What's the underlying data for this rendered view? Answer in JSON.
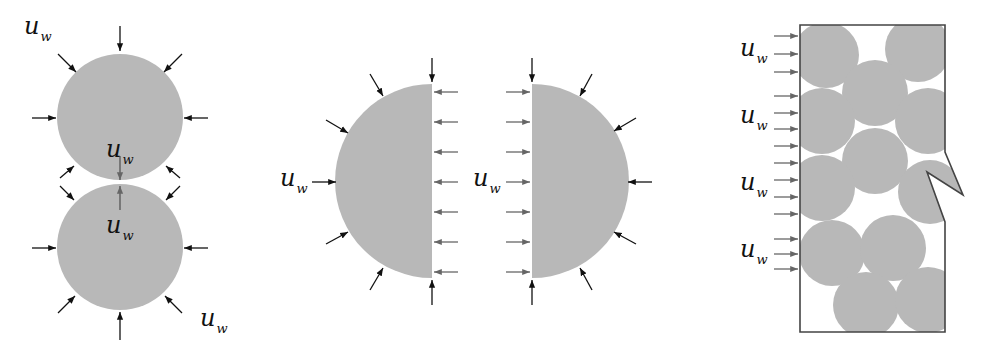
{
  "colors": {
    "particle_fill": "#b8b8b8",
    "arrow_dark": "#111111",
    "arrow_gray": "#666666",
    "box_stroke": "#444444",
    "background": "#ffffff"
  },
  "panels": [
    {
      "id": "two-touching-particles",
      "description": "Two circular particles in contact with pressure arrows acting around the boundary and at the contact point",
      "labels": [
        {
          "main": "u",
          "sub": "w",
          "x": 24,
          "y": 14
        },
        {
          "main": "u",
          "sub": "w",
          "x": 106,
          "y": 137
        },
        {
          "main": "u",
          "sub": "w",
          "x": 106,
          "y": 213
        },
        {
          "main": "u",
          "sub": "w",
          "x": 200,
          "y": 306
        }
      ]
    },
    {
      "id": "split-particle-halves",
      "description": "A particle split into two half-disks with uniform gray arrows on the flat cut faces",
      "labels": [
        {
          "main": "u",
          "sub": "w",
          "x": 280,
          "y": 166
        },
        {
          "main": "u",
          "sub": "w",
          "x": 473,
          "y": 166
        }
      ]
    },
    {
      "id": "packed-particle-box",
      "description": "Packed circular particles inside a rectangular domain with a notch on the right wall, uniform arrows on the left wall",
      "labels": [
        {
          "main": "u",
          "sub": "w",
          "x": 740,
          "y": 36
        },
        {
          "main": "u",
          "sub": "w",
          "x": 740,
          "y": 103
        },
        {
          "main": "u",
          "sub": "w",
          "x": 740,
          "y": 170
        },
        {
          "main": "u",
          "sub": "w",
          "x": 740,
          "y": 237
        }
      ]
    }
  ]
}
